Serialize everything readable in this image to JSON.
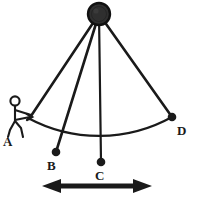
{
  "figure": {
    "kind": "physics-diagram",
    "canvas": {
      "width": 197,
      "height": 199
    },
    "background_color": "#ffffff",
    "ink_color": "#1a1a1a"
  },
  "pivot": {
    "name": "pivot-bob",
    "cx": 99,
    "cy": 14,
    "r": 11,
    "fill_color": "#2b2b2b",
    "stroke_color": "#111111"
  },
  "points": [
    {
      "id": "A",
      "label": "A",
      "x": 28,
      "y": 118,
      "marker": false,
      "label_x": 3,
      "label_y": 136
    },
    {
      "id": "B",
      "label": "B",
      "x": 56,
      "y": 152,
      "marker": true,
      "label_x": 47,
      "label_y": 160
    },
    {
      "id": "C",
      "label": "C",
      "x": 101,
      "y": 162,
      "marker": true,
      "label_x": 95,
      "label_y": 170
    },
    {
      "id": "D",
      "label": "D",
      "x": 172,
      "y": 117,
      "marker": true,
      "label_x": 177,
      "label_y": 125
    }
  ],
  "cords": [
    {
      "name": "cord-to-A",
      "from": "pivot",
      "to": "A"
    },
    {
      "name": "cord-to-B",
      "from": "pivot",
      "to": "B"
    },
    {
      "name": "cord-to-C",
      "from": "pivot",
      "to": "C"
    },
    {
      "name": "cord-to-D",
      "from": "pivot",
      "to": "D"
    }
  ],
  "arc": {
    "name": "swing-arc",
    "from_x": 28,
    "from_y": 118,
    "to_x": 172,
    "to_y": 117,
    "radius": 150,
    "sweep": 1,
    "description": "arc of pendulum swing through B and C"
  },
  "arrow": {
    "name": "amplitude-arrow",
    "x1": 42,
    "x2": 152,
    "y": 186,
    "double_headed": true,
    "head_length": 17,
    "head_width": 13
  },
  "person": {
    "name": "stick-figure-observer",
    "head_cx": 15,
    "head_cy": 101,
    "head_r": 4.5,
    "body_x": 15,
    "body_top": 106,
    "body_bottom": 122,
    "arm_to_x": 32,
    "arm_to_y": 116,
    "leg_left_x": 9,
    "leg_right_x": 24,
    "leg_y": 137
  }
}
